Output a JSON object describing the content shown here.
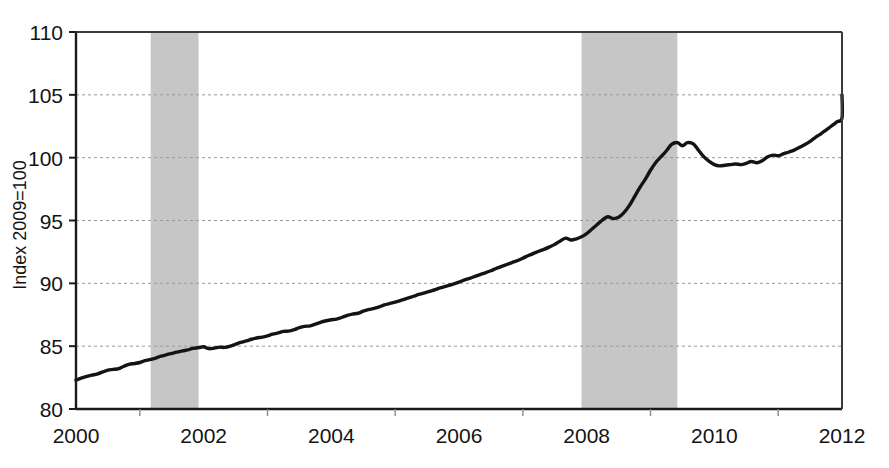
{
  "chart_data": {
    "type": "line",
    "title": "",
    "xlabel": "",
    "ylabel": "Index 2009=100",
    "xlim": [
      2000,
      2012
    ],
    "ylim": [
      80,
      110
    ],
    "grid": true,
    "grid_axis": "y",
    "legend": "none",
    "y_ticks": [
      80,
      85,
      90,
      95,
      100,
      105,
      110
    ],
    "y_tick_labels": [
      "80",
      "85",
      "90",
      "95",
      "100",
      "105",
      "110"
    ],
    "x_ticks": [
      2000,
      2002,
      2004,
      2006,
      2008,
      2010,
      2012
    ],
    "x_tick_labels": [
      "2000",
      "2002",
      "2004",
      "2006",
      "2008",
      "2010",
      "2012"
    ],
    "x_minor_ticks": [
      2001,
      2003,
      2005,
      2007,
      2009,
      2011
    ],
    "line_color": "#141414",
    "line_width": 3.4,
    "shaded_band_color": "#c6c6c6",
    "shaded_bands": [
      {
        "name": "recession-2001",
        "x0": 2001.17,
        "x1": 2001.92
      },
      {
        "name": "recession-2008",
        "x0": 2007.92,
        "x1": 2009.42
      }
    ],
    "series": [
      {
        "name": "Index",
        "x": [
          2000.0,
          2000.08,
          2000.17,
          2000.25,
          2000.33,
          2000.42,
          2000.5,
          2000.58,
          2000.67,
          2000.75,
          2000.83,
          2000.92,
          2001.0,
          2001.08,
          2001.17,
          2001.25,
          2001.33,
          2001.42,
          2001.5,
          2001.58,
          2001.67,
          2001.75,
          2001.83,
          2001.92,
          2002.0,
          2002.08,
          2002.17,
          2002.25,
          2002.33,
          2002.42,
          2002.5,
          2002.58,
          2002.67,
          2002.75,
          2002.83,
          2002.92,
          2003.0,
          2003.08,
          2003.17,
          2003.25,
          2003.33,
          2003.42,
          2003.5,
          2003.58,
          2003.67,
          2003.75,
          2003.83,
          2003.92,
          2004.0,
          2004.08,
          2004.17,
          2004.25,
          2004.33,
          2004.42,
          2004.5,
          2004.58,
          2004.67,
          2004.75,
          2004.83,
          2004.92,
          2005.0,
          2005.08,
          2005.17,
          2005.25,
          2005.33,
          2005.42,
          2005.5,
          2005.58,
          2005.67,
          2005.75,
          2005.83,
          2005.92,
          2006.0,
          2006.08,
          2006.17,
          2006.25,
          2006.33,
          2006.42,
          2006.5,
          2006.58,
          2006.67,
          2006.75,
          2006.83,
          2006.92,
          2007.0,
          2007.08,
          2007.17,
          2007.25,
          2007.33,
          2007.42,
          2007.5,
          2007.58,
          2007.67,
          2007.75,
          2007.83,
          2007.92,
          2008.0,
          2008.08,
          2008.17,
          2008.25,
          2008.33,
          2008.42,
          2008.5,
          2008.58,
          2008.67,
          2008.75,
          2008.83,
          2008.92,
          2009.0,
          2009.08,
          2009.17,
          2009.25,
          2009.33,
          2009.42,
          2009.5,
          2009.58,
          2009.67,
          2009.75,
          2009.83,
          2009.92,
          2010.0,
          2010.08,
          2010.17,
          2010.25,
          2010.33,
          2010.42,
          2010.5,
          2010.58,
          2010.67,
          2010.75,
          2010.83,
          2010.92,
          2011.0,
          2011.08,
          2011.17,
          2011.25,
          2011.33,
          2011.42,
          2011.5,
          2011.58,
          2011.67,
          2011.75,
          2011.83,
          2011.92,
          2012.0
        ],
        "y": [
          82.3,
          82.45,
          82.6,
          82.7,
          82.78,
          82.95,
          83.1,
          83.15,
          83.22,
          83.4,
          83.55,
          83.62,
          83.7,
          83.85,
          83.95,
          84.05,
          84.2,
          84.32,
          84.42,
          84.52,
          84.62,
          84.7,
          84.82,
          84.88,
          84.95,
          84.8,
          84.85,
          84.92,
          84.9,
          85.0,
          85.15,
          85.3,
          85.42,
          85.55,
          85.65,
          85.72,
          85.82,
          85.95,
          86.05,
          86.18,
          86.2,
          86.32,
          86.48,
          86.58,
          86.62,
          86.75,
          86.9,
          87.02,
          87.1,
          87.15,
          87.3,
          87.45,
          87.55,
          87.62,
          87.78,
          87.9,
          88.0,
          88.12,
          88.28,
          88.4,
          88.5,
          88.62,
          88.78,
          88.9,
          89.05,
          89.18,
          89.3,
          89.42,
          89.58,
          89.7,
          89.82,
          89.95,
          90.1,
          90.25,
          90.4,
          90.55,
          90.7,
          90.85,
          91.0,
          91.18,
          91.35,
          91.5,
          91.65,
          91.82,
          92.0,
          92.2,
          92.38,
          92.55,
          92.7,
          92.9,
          93.1,
          93.35,
          93.6,
          93.45,
          93.52,
          93.7,
          93.95,
          94.3,
          94.7,
          95.05,
          95.3,
          95.15,
          95.25,
          95.6,
          96.2,
          96.9,
          97.6,
          98.3,
          99.0,
          99.6,
          100.1,
          100.55,
          101.05,
          101.2,
          100.95,
          101.2,
          101.1,
          100.6,
          100.1,
          99.7,
          99.45,
          99.35,
          99.4,
          99.45,
          99.5,
          99.45,
          99.55,
          99.7,
          99.6,
          99.75,
          100.05,
          100.2,
          100.15,
          100.3,
          100.45,
          100.6,
          100.8,
          101.05,
          101.3,
          101.6,
          101.9,
          102.2,
          102.5,
          102.85,
          103.15
        ]
      }
    ],
    "series_extension": {
      "note": "continuation to 2012",
      "x": [
        2012.0
      ],
      "y": [
        105.0
      ]
    },
    "annotations": []
  },
  "axis": {
    "y_label": "Index 2009=100"
  }
}
